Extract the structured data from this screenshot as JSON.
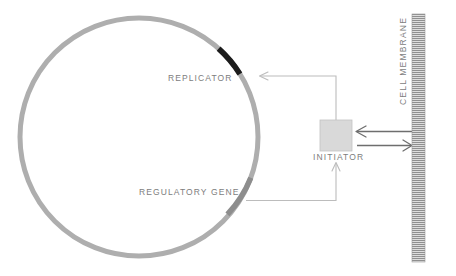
{
  "diagram": {
    "background_color": "#ffffff",
    "labels": {
      "replicator": "REPLICATOR",
      "regulatory_gene": "REGULATORY GENE",
      "initiator": "INITIATOR",
      "cell_membrane": "CELL MEMBRANE"
    },
    "colors": {
      "chromosome_ring": "#aeaeae",
      "replicator_segment": "#1c1c1c",
      "regulatory_gene_segment": "#8d8d8d",
      "initiator_box_fill": "#d8d8d8",
      "initiator_box_stroke": "#b4b4b4",
      "membrane_band": "#9a9a9a",
      "connector_line": "#b9b9b9",
      "transport_arrow": "#6e6e6e",
      "label_text": "#7d7d7d"
    },
    "shapes": {
      "chromosome_ring": {
        "name": "circular-chromosome",
        "center_x": 139,
        "center_y": 137,
        "radius": 119,
        "stroke_width": 5
      },
      "replicator_segment": {
        "name": "replicator-locus",
        "start_angle_deg": -48,
        "end_angle_deg": -32
      },
      "regulatory_gene_segment": {
        "name": "regulatory-gene-locus",
        "start_angle_deg": 20,
        "end_angle_deg": 42
      },
      "initiator_box": {
        "name": "initiator-protein",
        "x": 320,
        "y": 120,
        "width": 32,
        "height": 31
      },
      "membrane_band": {
        "name": "cell-membrane-band",
        "x": 412,
        "y": 14,
        "width": 13,
        "height": 248,
        "stripe_spacing": 2
      }
    },
    "connectors": [
      {
        "name": "initiator-to-replicator",
        "from": "initiator-box-top",
        "to": "replicator-locus",
        "arrowhead": "left"
      },
      {
        "name": "regulatory-gene-to-initiator",
        "from": "regulatory-gene-locus",
        "to": "initiator-box-bottom",
        "arrowhead": "up"
      },
      {
        "name": "membrane-to-initiator",
        "from": "cell-membrane",
        "to": "initiator-box",
        "arrowhead": "left"
      },
      {
        "name": "initiator-to-membrane",
        "from": "initiator-box",
        "to": "cell-membrane",
        "arrowhead": "right"
      }
    ]
  }
}
